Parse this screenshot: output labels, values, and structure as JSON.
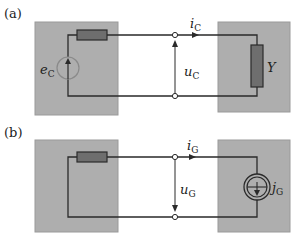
{
  "panels": [
    {
      "id": "a",
      "label": "(a)",
      "source_label": {
        "main": "e",
        "sub": "C"
      },
      "current_label": {
        "main": "i",
        "sub": "C"
      },
      "voltage_label": {
        "main": "u",
        "sub": "C"
      },
      "load_label": {
        "main": "Y",
        "sub": ""
      },
      "source_type": "voltage-source",
      "load_type": "admittance"
    },
    {
      "id": "b",
      "label": "(b)",
      "current_label": {
        "main": "i",
        "sub": "G"
      },
      "voltage_label": {
        "main": "u",
        "sub": "G"
      },
      "load_label": {
        "main": "j",
        "sub": "G"
      },
      "source_type": "none",
      "load_type": "current-source"
    }
  ],
  "colors": {
    "box_fill": "#aeaeae",
    "box_stroke": "#9a9a9a",
    "wire": "#2a2a2a",
    "resistor_fill": "#6e6e6e",
    "source_stroke": "#8a8a8a",
    "terminal_fill": "#ffffff"
  }
}
